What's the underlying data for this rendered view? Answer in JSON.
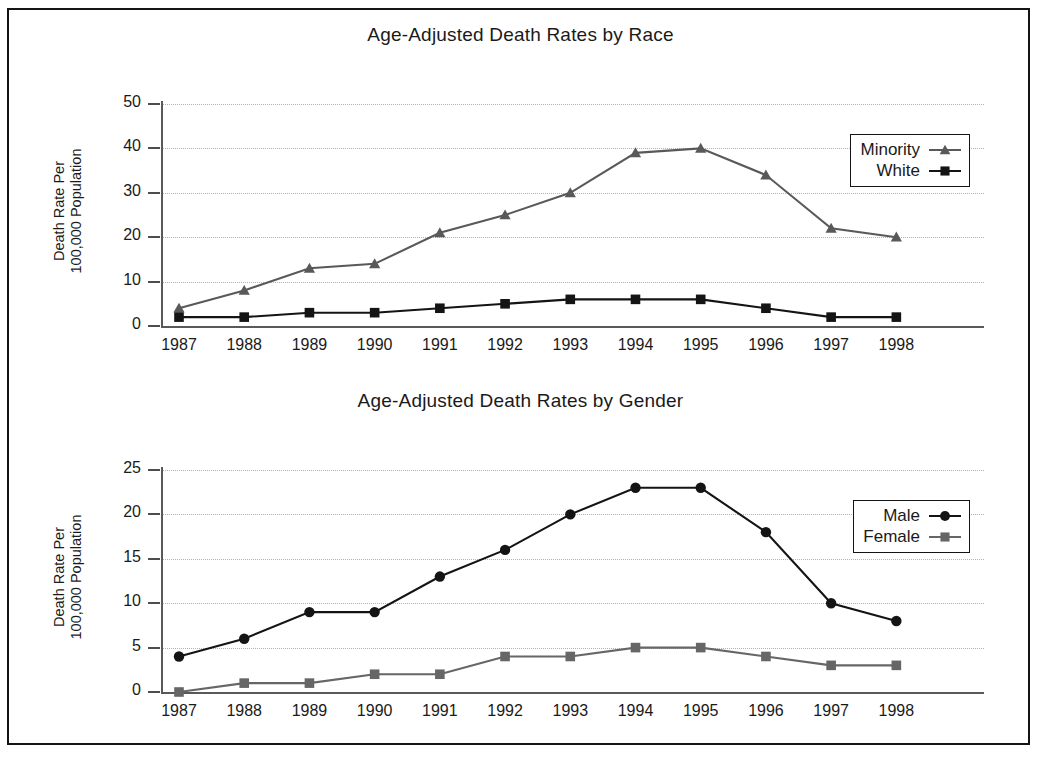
{
  "page": {
    "background_color": "#ffffff",
    "frame_color": "#141414"
  },
  "charts": [
    {
      "id": "race",
      "title": "Age-Adjusted Death Rates by Race",
      "y_axis_label_line1": "Death Rate Per",
      "y_axis_label_line2": "100,000 Population",
      "y_ticks": [
        "0",
        "10",
        "20",
        "30",
        "40",
        "50"
      ],
      "x_ticks": [
        "1987",
        "1988",
        "1989",
        "1990",
        "1991",
        "1992",
        "1993",
        "1994",
        "1995",
        "1996",
        "1997",
        "1998"
      ],
      "legend": [
        {
          "label": "Minority",
          "marker": "triangle",
          "color": "#595959"
        },
        {
          "label": "White",
          "marker": "square",
          "color": "#141414"
        }
      ]
    },
    {
      "id": "gender",
      "title": "Age-Adjusted Death Rates by Gender",
      "y_axis_label_line1": "Death Rate Per",
      "y_axis_label_line2": "100,000 Population",
      "y_ticks": [
        "0",
        "5",
        "10",
        "15",
        "20",
        "25"
      ],
      "x_ticks": [
        "1987",
        "1988",
        "1989",
        "1990",
        "1991",
        "1992",
        "1993",
        "1994",
        "1995",
        "1996",
        "1997",
        "1998"
      ],
      "legend": [
        {
          "label": "Male",
          "marker": "circle",
          "color": "#141414"
        },
        {
          "label": "Female",
          "marker": "square",
          "color": "#666666"
        }
      ]
    }
  ],
  "chart_data": [
    {
      "type": "line",
      "title": "Age-Adjusted Death Rates by Race",
      "xlabel": "",
      "ylabel": "Death Rate Per 100,000 Population",
      "categories": [
        "1987",
        "1988",
        "1989",
        "1990",
        "1991",
        "1992",
        "1993",
        "1994",
        "1995",
        "1996",
        "1997",
        "1998"
      ],
      "series": [
        {
          "name": "Minority",
          "marker": "triangle",
          "color": "#595959",
          "values": [
            4,
            8,
            13,
            14,
            21,
            25,
            30,
            39,
            40,
            34,
            22,
            20
          ]
        },
        {
          "name": "White",
          "marker": "square",
          "color": "#141414",
          "values": [
            2,
            2,
            3,
            3,
            4,
            5,
            6,
            6,
            6,
            4,
            2,
            2
          ]
        }
      ],
      "ylim": [
        0,
        50
      ],
      "yticks": [
        0,
        10,
        20,
        30,
        40,
        50
      ],
      "grid": true,
      "legend_position": "top-right"
    },
    {
      "type": "line",
      "title": "Age-Adjusted Death Rates by Gender",
      "xlabel": "",
      "ylabel": "Death Rate Per 100,000 Population",
      "categories": [
        "1987",
        "1988",
        "1989",
        "1990",
        "1991",
        "1992",
        "1993",
        "1994",
        "1995",
        "1996",
        "1997",
        "1998"
      ],
      "series": [
        {
          "name": "Male",
          "marker": "circle",
          "color": "#141414",
          "values": [
            4,
            6,
            9,
            9,
            13,
            16,
            20,
            23,
            23,
            18,
            10,
            8
          ]
        },
        {
          "name": "Female",
          "marker": "square",
          "color": "#666666",
          "values": [
            0,
            1,
            1,
            2,
            2,
            4,
            4,
            5,
            5,
            4,
            3,
            3
          ]
        }
      ],
      "ylim": [
        0,
        25
      ],
      "yticks": [
        0,
        5,
        10,
        15,
        20,
        25
      ],
      "grid": true,
      "legend_position": "top-right"
    }
  ]
}
